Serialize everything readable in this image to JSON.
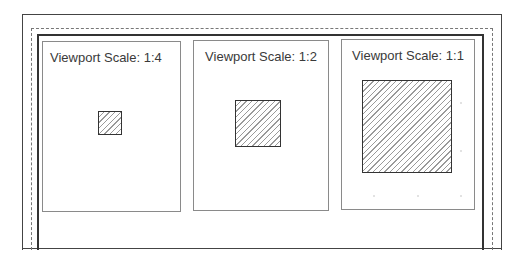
{
  "sheet": {
    "frames": [
      "outer-border",
      "dashed-printable-area",
      "inner-border"
    ]
  },
  "viewports": [
    {
      "label": "Viewport Scale: 1:4",
      "scale": "1:4",
      "square_size_px": 23
    },
    {
      "label": "Viewport Scale: 1:2",
      "scale": "1:2",
      "square_size_px": 45
    },
    {
      "label": "Viewport Scale: 1:1",
      "scale": "1:1",
      "square_size_px": 90
    }
  ],
  "colors": {
    "frame": "#444444",
    "viewport_border": "#8a8a8a",
    "hatch": "#9a9a9a",
    "text": "#3a3a3a"
  }
}
